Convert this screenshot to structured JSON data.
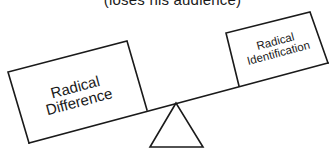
{
  "diagram": {
    "type": "seesaw-balance",
    "caption": "(loses his audience)",
    "left_box": {
      "lines": [
        "Radical",
        "Difference"
      ],
      "side": "left",
      "position": "lower (heavier side)"
    },
    "right_box": {
      "lines": [
        "Radical",
        "Identification"
      ],
      "side": "right",
      "position": "raised (lighter side)"
    },
    "fulcrum": "triangle",
    "colors": {
      "ink": "#1a1a1a",
      "background": "#ffffff"
    }
  }
}
